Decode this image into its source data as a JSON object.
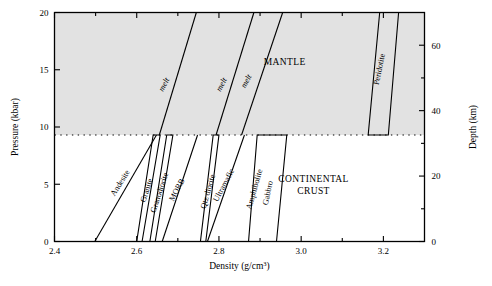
{
  "chart_data": {
    "type": "line",
    "title": "",
    "xlabel": "Density (g/cm3)",
    "xlabel_main": "Density (g/cm",
    "xlabel_sup": "3",
    "xlabel_close": ")",
    "ylabel_left": "Pressure (kbar)",
    "ylabel_right": "Depth (km)",
    "xlim": [
      2.4,
      3.3
    ],
    "ylim_left": [
      0,
      20
    ],
    "ylim_right": [
      0,
      70
    ],
    "x_ticks_major": [
      2.4,
      2.6,
      2.8,
      3.0,
      3.2
    ],
    "x_ticks_major_labels": [
      "2.4",
      "2.6",
      "2.8",
      "3.0",
      "3.2"
    ],
    "x_ticks_minor": [
      2.5,
      2.7,
      2.9,
      3.1,
      3.3
    ],
    "y_ticks_left_major": [
      0,
      5,
      10,
      15,
      20
    ],
    "y_ticks_left_labels": [
      "0",
      "5",
      "10",
      "15",
      "20"
    ],
    "y_ticks_right_major": [
      0,
      20,
      40,
      60
    ],
    "y_ticks_right_labels": [
      "0",
      "20",
      "40",
      "60"
    ],
    "y_ticks_right_minor": [
      10,
      30,
      50,
      70
    ],
    "grid": false,
    "legend": "none",
    "moho_pressure_kbar": 9.3,
    "shaded_region_color": "#e2e2e2",
    "line_color": "#000000",
    "regions": [
      {
        "name": "MANTLE",
        "label": "MANTLE",
        "x": 2.96,
        "p": 15.4
      },
      {
        "name": "CONTINENTAL CRUST",
        "label_line1": "CONTINENTAL",
        "label_line2": "CRUST",
        "x": 3.03,
        "p": 5.2
      }
    ],
    "melt_curves": [
      {
        "name": "melt-1",
        "label": "melt",
        "points": [
          [
            2.655,
            9.3
          ],
          [
            2.745,
            20.0
          ]
        ],
        "label_x": 2.672,
        "label_p": 13.6
      },
      {
        "name": "melt-2",
        "label": "melt",
        "points": [
          [
            2.793,
            9.3
          ],
          [
            2.885,
            20.0
          ]
        ],
        "label_x": 2.812,
        "label_p": 13.6
      },
      {
        "name": "melt-3",
        "label": "melt",
        "points": [
          [
            2.855,
            9.3
          ],
          [
            2.955,
            20.0
          ]
        ],
        "label_x": 2.872,
        "label_p": 13.9
      }
    ],
    "rock_bodies": [
      {
        "name": "Andesite",
        "label": "Andesite",
        "kind": "line",
        "points": [
          [
            2.498,
            0.0
          ],
          [
            2.648,
            9.3
          ]
        ],
        "label_x": 2.565,
        "label_p": 5.0,
        "angle": -58
      },
      {
        "name": "Granite",
        "label": "Granite",
        "kind": "polygon",
        "points": [
          [
            2.6,
            0.0
          ],
          [
            2.613,
            0.0
          ],
          [
            2.657,
            9.3
          ],
          [
            2.64,
            9.3
          ]
        ],
        "label_x": 2.63,
        "label_p": 4.4,
        "angle": -72
      },
      {
        "name": "Granodiorite",
        "label": "Granodiorite",
        "kind": "polygon",
        "points": [
          [
            2.632,
            0.0
          ],
          [
            2.645,
            0.0
          ],
          [
            2.688,
            9.3
          ],
          [
            2.673,
            9.3
          ]
        ],
        "label_x": 2.661,
        "label_p": 4.2,
        "angle": -72
      },
      {
        "name": "MORB",
        "label": "MORB",
        "kind": "line",
        "points": [
          [
            2.662,
            0.0
          ],
          [
            2.748,
            9.3
          ]
        ],
        "label_x": 2.703,
        "label_p": 4.4,
        "angle": -62
      },
      {
        "name": "Qtz diorite",
        "label": "Qtz diorite",
        "kind": "polygon",
        "points": [
          [
            2.755,
            0.0
          ],
          [
            2.768,
            0.0
          ],
          [
            2.8,
            9.3
          ],
          [
            2.786,
            9.3
          ]
        ],
        "label_x": 2.779,
        "label_p": 4.3,
        "angle": -74
      },
      {
        "name": "Ultramafic",
        "label": "Ultramafic",
        "kind": "line",
        "points": [
          [
            2.772,
            0.0
          ],
          [
            2.862,
            9.3
          ]
        ],
        "label_x": 2.817,
        "label_p": 4.8,
        "angle": -62
      },
      {
        "name": "Amphibolite-Gabbro",
        "label_a": "Amphibolite",
        "label_b": "Gabbro",
        "kind": "polygon",
        "points": [
          [
            2.872,
            0.0
          ],
          [
            2.94,
            0.0
          ],
          [
            2.965,
            9.3
          ],
          [
            2.893,
            9.3
          ]
        ],
        "label_a_x": 2.892,
        "label_a_p": 4.5,
        "label_a_angle": -74,
        "label_b_x": 2.925,
        "label_b_p": 4.2,
        "label_b_angle": -78
      },
      {
        "name": "Peridotite",
        "label": "Peridotite",
        "kind": "polygon",
        "points": [
          [
            3.163,
            9.3
          ],
          [
            3.212,
            9.3
          ],
          [
            3.237,
            20.0
          ],
          [
            3.191,
            20.0
          ]
        ],
        "label_x": 3.196,
        "label_p": 15.0,
        "angle": -78
      }
    ]
  },
  "figure": {
    "xlabel_text": "Density (g/cm",
    "xlabel_superscript": "3",
    "xlabel_tail": ")"
  }
}
